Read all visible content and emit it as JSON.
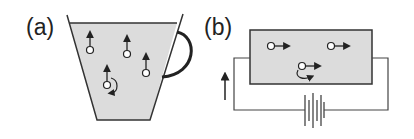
{
  "panels": [
    {
      "label": "(a)",
      "description": "cup of liquid with particles moving upward",
      "particles": [
        {
          "x": 90,
          "y": 50,
          "arrow": "up"
        },
        {
          "x": 127,
          "y": 54,
          "arrow": "up"
        },
        {
          "x": 146,
          "y": 73,
          "arrow": "up"
        },
        {
          "x": 107,
          "y": 85,
          "arrow": "up",
          "rotation": true
        }
      ]
    },
    {
      "label": "(b)",
      "description": "liquid cell in circuit with battery, particles moving right",
      "particles": [
        {
          "x": 271,
          "y": 46,
          "arrow": "right"
        },
        {
          "x": 331,
          "y": 46,
          "arrow": "right"
        },
        {
          "x": 302,
          "y": 66,
          "arrow": "right",
          "rotation": true
        }
      ]
    }
  ],
  "colors": {
    "fill": "#dcdcdc",
    "stroke": "#222222",
    "background": "#ffffff"
  }
}
